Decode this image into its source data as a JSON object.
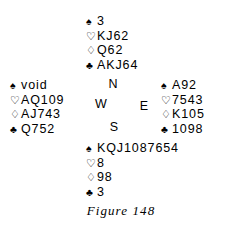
{
  "figure": {
    "caption": "Figure 148"
  },
  "suits": {
    "spade": "♠",
    "heart": "♡",
    "diamond": "♢",
    "club": "♣"
  },
  "compass": {
    "north": "N",
    "west": "W",
    "east": "E",
    "south": "S"
  },
  "hands": {
    "north": {
      "label": "North",
      "spades": "3",
      "hearts": "KJ62",
      "diamonds": "Q62",
      "clubs": "AKJ64"
    },
    "west": {
      "label": "West",
      "spades": "void",
      "hearts": "AQ109",
      "diamonds": "AJ743",
      "clubs": "Q752"
    },
    "east": {
      "label": "East",
      "spades": "A92",
      "hearts": "7543",
      "diamonds": "K105",
      "clubs": "1098"
    },
    "south": {
      "label": "South",
      "spades": "KQJ1087654",
      "hearts": "8",
      "diamonds": "98",
      "clubs": "3"
    }
  }
}
